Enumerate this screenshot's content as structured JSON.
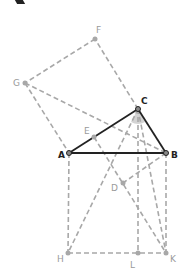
{
  "figure": {
    "colors": {
      "triangle": "#222222",
      "construction": "#a8a8a8",
      "label_primary": "#222222",
      "label_secondary": "#9a9a9a",
      "highlight": "#bbbbbb"
    },
    "points": {
      "A": {
        "label": "A",
        "x": 69,
        "y": 153
      },
      "B": {
        "label": "B",
        "x": 166,
        "y": 153
      },
      "C": {
        "label": "C",
        "x": 138,
        "y": 109
      },
      "D": {
        "label": "D",
        "x": 123,
        "y": 183
      },
      "E": {
        "label": "E",
        "x": 94,
        "y": 137
      },
      "F": {
        "label": "F",
        "x": 95,
        "y": 39
      },
      "G": {
        "label": "G",
        "x": 25,
        "y": 83
      },
      "H": {
        "label": "H",
        "x": 68,
        "y": 253
      },
      "L": {
        "label": "L",
        "x": 138,
        "y": 253
      },
      "K": {
        "label": "K",
        "x": 166,
        "y": 253
      }
    },
    "solid_segments": [
      "AB",
      "AC",
      "BC"
    ],
    "dashed_segments": [
      "CF",
      "FG",
      "GA",
      "GB",
      "AH",
      "HL",
      "LK",
      "BK",
      "CL",
      "CH",
      "CK",
      "EK",
      "BD"
    ]
  }
}
